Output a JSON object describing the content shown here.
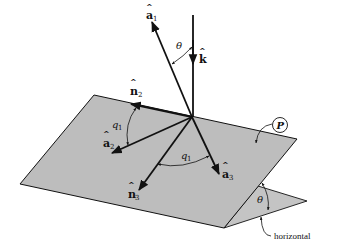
{
  "diagram": {
    "title": "",
    "colors": {
      "plane_fill": "#bdbdbd",
      "stroke": "#111111",
      "background": "#ffffff"
    },
    "vectors": {
      "k": {
        "label": "k",
        "hat": "^",
        "subscript": ""
      },
      "a1": {
        "label": "a",
        "hat": "^",
        "subscript": "1"
      },
      "n2": {
        "label": "n",
        "hat": "^",
        "subscript": "2"
      },
      "a2": {
        "label": "a",
        "hat": "^",
        "subscript": "2"
      },
      "n3": {
        "label": "n",
        "hat": "^",
        "subscript": "3"
      },
      "a3": {
        "label": "a",
        "hat": "^",
        "subscript": "3"
      }
    },
    "angles": {
      "theta_top": "θ",
      "q1_left": "q",
      "q1_left_sub": "1",
      "q1_bottom": "q",
      "q1_bottom_sub": "1",
      "theta_incline": "θ"
    },
    "plane_label": "P",
    "horizontal_label": "horizontal"
  }
}
